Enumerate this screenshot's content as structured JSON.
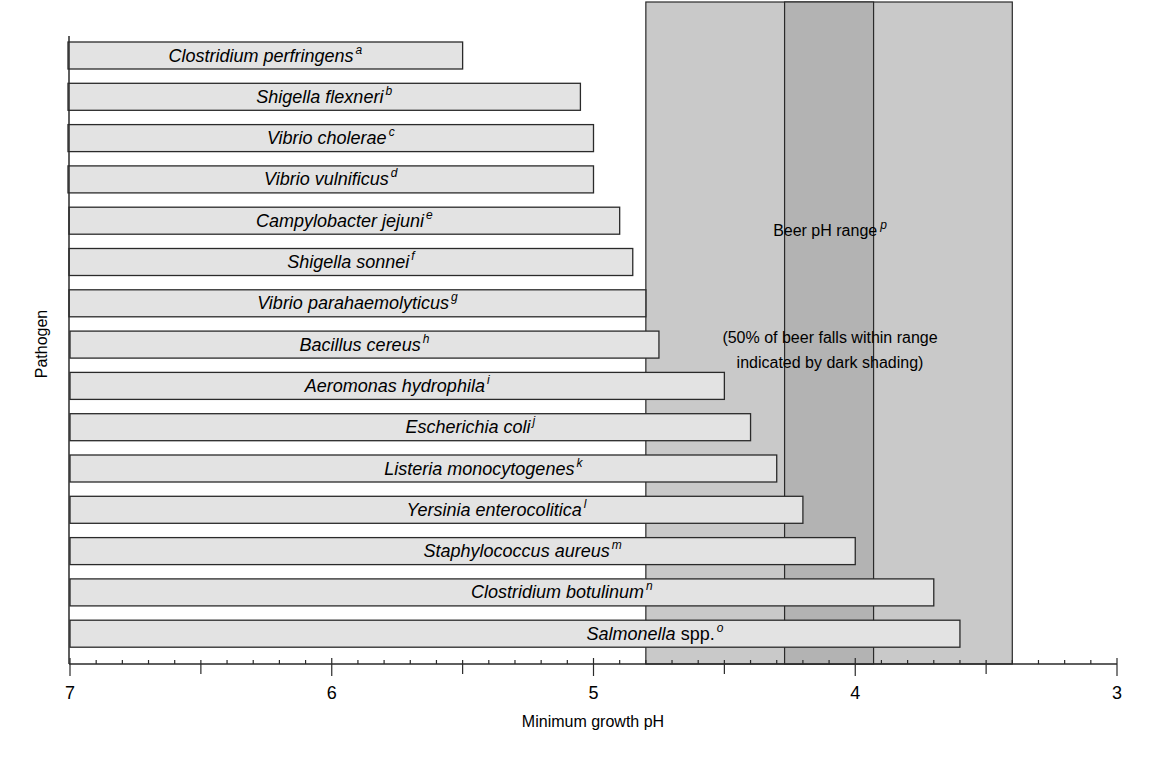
{
  "chart_data": {
    "type": "bar",
    "orientation": "horizontal",
    "title": "",
    "xlabel": "Minimum growth pH",
    "ylabel": "Pathogen",
    "xlim": [
      7,
      3
    ],
    "x_reversed": true,
    "x_ticks": [
      7,
      6,
      5,
      4,
      3
    ],
    "x_minor_step": 0.1,
    "grid": false,
    "legend": null,
    "categories": [
      {
        "name": "Clostridium perfringens",
        "sup": "a",
        "italic_part": "Clostridium perfringens",
        "plain_part": ""
      },
      {
        "name": "Shigella flexneri",
        "sup": "b",
        "italic_part": "Shigella flexneri",
        "plain_part": ""
      },
      {
        "name": "Vibrio cholerae",
        "sup": "c",
        "italic_part": "Vibrio cholerae",
        "plain_part": ""
      },
      {
        "name": "Vibrio vulnificus",
        "sup": "d",
        "italic_part": "Vibrio vulnificus",
        "plain_part": ""
      },
      {
        "name": "Campylobacter jejuni",
        "sup": "e",
        "italic_part": "Campylobacter jejuni",
        "plain_part": ""
      },
      {
        "name": "Shigella sonnei",
        "sup": "f",
        "italic_part": "Shigella sonnei",
        "plain_part": ""
      },
      {
        "name": "Vibrio parahaemolyticus",
        "sup": "g",
        "italic_part": "Vibrio parahaemolyticus",
        "plain_part": ""
      },
      {
        "name": "Bacillus cereus",
        "sup": "h",
        "italic_part": "Bacillus cereus",
        "plain_part": ""
      },
      {
        "name": "Aeromonas hydrophila",
        "sup": "i",
        "italic_part": "Aeromonas hydrophila",
        "plain_part": ""
      },
      {
        "name": "Escherichia coli",
        "sup": "j",
        "italic_part": "Escherichia coli",
        "plain_part": ""
      },
      {
        "name": "Listeria monocytogenes",
        "sup": "k",
        "italic_part": "Listeria monocytogenes",
        "plain_part": ""
      },
      {
        "name": "Yersinia enterocolitica",
        "sup": "l",
        "italic_part": "Yersinia enterocolitica",
        "plain_part": ""
      },
      {
        "name": "Staphylococcus aureus",
        "sup": "m",
        "italic_part": "Staphylococcus aureus",
        "plain_part": ""
      },
      {
        "name": "Clostridium botulinum",
        "sup": "n",
        "italic_part": "Clostridium botulinum",
        "plain_part": ""
      },
      {
        "name": "Salmonella spp.",
        "sup": "o",
        "italic_part": "Salmonella",
        "plain_part": " spp."
      }
    ],
    "values": [
      5.5,
      5.05,
      5.0,
      5.0,
      4.9,
      4.85,
      4.8,
      4.75,
      4.5,
      4.4,
      4.3,
      4.2,
      4.0,
      3.7,
      3.6
    ],
    "shaded_regions": [
      {
        "name": "Beer pH range",
        "sup": "p",
        "from": 4.8,
        "to": 3.4,
        "shade": "light"
      },
      {
        "name": "50% of beer",
        "from": 4.27,
        "to": 3.93,
        "shade": "dark"
      }
    ],
    "annotations": [
      {
        "text": "Beer pH range",
        "sup": "p"
      },
      {
        "text_line1": "(50% of beer falls within range",
        "text_line2": "indicated by dark shading)"
      }
    ],
    "colors": {
      "bar_fill": "#e3e3e3",
      "bar_stroke": "#2a2a2a",
      "beer_range_fill": "#c9c9c9",
      "beer_dark_fill": "#b3b3b3",
      "axis": "#2a2a2a"
    }
  }
}
